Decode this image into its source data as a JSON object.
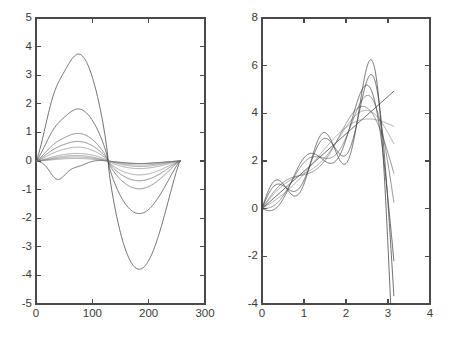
{
  "figure": {
    "title": "",
    "background_color": "#ffffff",
    "line_color": "#3d3d3d",
    "axis_color": "#4a4a4a",
    "panel_count": 2
  },
  "chart_data": [
    {
      "type": "line",
      "panel": "left",
      "title": "",
      "xlabel": "",
      "ylabel": "",
      "xlim": [
        0,
        300
      ],
      "ylim": [
        -5,
        5
      ],
      "xticks": [
        0,
        100,
        200,
        300
      ],
      "yticks": [
        -5,
        -4,
        -3,
        -2,
        -1,
        0,
        1,
        2,
        3,
        4,
        5
      ],
      "xticklabels": [
        "0",
        "100",
        "200",
        "300"
      ],
      "yticklabels": [
        "-5",
        "-4",
        "-3",
        "-2",
        "-1",
        "0",
        "1",
        "2",
        "3",
        "4",
        "5"
      ],
      "grid": false,
      "legend": false,
      "legend_position": "none",
      "n_series": 7,
      "x_data_range": [
        0,
        256
      ],
      "description": "Family of antisymmetric sinusoid-like curves of increasing amplitude; positive lobe peaks near x=120, negative lobe troughs near x=212.",
      "series": [
        {
          "name": "curve-1",
          "amplitude": 0.3,
          "peak_x": 120,
          "peak_y": 0.3,
          "trough_x": 212,
          "trough_y": -0.3
        },
        {
          "name": "curve-2",
          "amplitude": 0.55,
          "peak_x": 120,
          "peak_y": 0.55,
          "trough_x": 212,
          "trough_y": -0.55
        },
        {
          "name": "curve-3",
          "amplitude": 0.78,
          "peak_x": 120,
          "peak_y": 0.78,
          "trough_x": 212,
          "trough_y": -0.78
        },
        {
          "name": "curve-4",
          "amplitude": 1.1,
          "peak_x": 120,
          "peak_y": 1.1,
          "trough_x": 212,
          "trough_y": -1.1
        },
        {
          "name": "curve-5",
          "amplitude": 2.08,
          "peak_x": 120,
          "peak_y": 2.08,
          "trough_x": 212,
          "trough_y": -1.78
        },
        {
          "name": "curve-6",
          "amplitude": 4.28,
          "peak_x": 120,
          "peak_y": 4.28,
          "trough_x": 212,
          "trough_y": -4.3
        },
        {
          "name": "curve-7-ripple",
          "amplitude": 0.95,
          "peak_x": 35,
          "peak_y": -0.95,
          "trough_x": 35,
          "trough_y": -0.95
        }
      ]
    },
    {
      "type": "line",
      "panel": "right",
      "title": "",
      "xlabel": "",
      "ylabel": "",
      "xlim": [
        0,
        4
      ],
      "ylim": [
        -4,
        8
      ],
      "xticks": [
        0,
        1,
        2,
        3,
        4
      ],
      "yticks": [
        -4,
        -2,
        0,
        2,
        4,
        6,
        8
      ],
      "xticklabels": [
        "0",
        "1",
        "2",
        "3",
        "4"
      ],
      "yticklabels": [
        "-4",
        "-2",
        "0",
        "2",
        "4",
        "6",
        "8"
      ],
      "grid": false,
      "legend": false,
      "legend_position": "none",
      "n_series": 7,
      "x_data_range": [
        0,
        3.14
      ],
      "description": "Family of partial-sum approximations to a linear ramp y = 1.57x, showing Gibbs-style oscillations of growing amplitude; overshoot peaks near x=0.33 (4.7), x=1.45 (3.2) and x=2.33 (7.95); undershoot troughs near x=0.86 (-2.9) and x=2.85 (0.3).",
      "baseline": {
        "name": "ramp",
        "slope": 1.57,
        "intercept": 0.0,
        "y_at_0": 0.0,
        "y_at_pi": 4.93
      },
      "series": [
        {
          "name": "curve-1",
          "overshoot": 0.35,
          "max_y": 1.05,
          "min_y": 0.55
        },
        {
          "name": "curve-2",
          "overshoot": 0.6,
          "max_y": 1.35,
          "min_y": 0.3
        },
        {
          "name": "curve-3",
          "overshoot": 0.9,
          "max_y": 1.7,
          "min_y": -0.1
        },
        {
          "name": "curve-4",
          "overshoot": 1.4,
          "max_y": 2.15,
          "min_y": -0.7
        },
        {
          "name": "curve-5",
          "overshoot": 2.3,
          "max_y": 3.05,
          "min_y": -1.55
        },
        {
          "name": "curve-6",
          "overshoot": 3.6,
          "max_y": 5.65,
          "min_y": -2.1
        },
        {
          "name": "curve-7",
          "overshoot": 5.2,
          "max_y": 7.95,
          "min_y": -2.9
        }
      ]
    }
  ]
}
